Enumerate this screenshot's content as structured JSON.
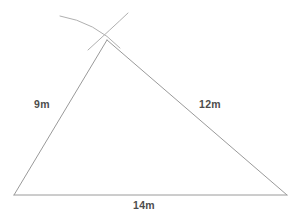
{
  "figure": {
    "background_color": "#ffffff",
    "stroke_color": "#9a9a9a",
    "arc_color": "#b0b0b0",
    "text_color": "#4d4d4d",
    "canvas": {
      "width": 294,
      "height": 218
    }
  },
  "triangle": {
    "vertices": {
      "apex": {
        "name": "apex-vertex",
        "x": 107,
        "y": 40
      },
      "bottom_left": {
        "name": "bottom-left-vertex",
        "x": 14,
        "y": 195
      },
      "bottom_right": {
        "name": "bottom-right-vertex",
        "x": 287,
        "y": 195
      }
    },
    "sides": [
      {
        "id": "left",
        "label": "9m",
        "from": "bottom_left",
        "to": "apex",
        "value": 9,
        "unit": "m"
      },
      {
        "id": "right",
        "label": "12m",
        "from": "apex",
        "to": "bottom_right",
        "value": 12,
        "unit": "m"
      },
      {
        "id": "base",
        "label": "14m",
        "from": "bottom_left",
        "to": "bottom_right",
        "value": 14,
        "unit": "m"
      }
    ]
  },
  "construction_arcs": [
    {
      "id": "arc-left",
      "description": "compass arc swept from bottom-left vertex with radius 9m",
      "start": {
        "x": 60,
        "y": 16
      },
      "control": {
        "x": 95,
        "y": 22
      },
      "end": {
        "x": 120,
        "y": 48
      }
    },
    {
      "id": "arc-right",
      "description": "compass arc swept from bottom-right vertex with radius 12m",
      "start": {
        "x": 128,
        "y": 13
      },
      "control": {
        "x": 111,
        "y": 29
      },
      "end": {
        "x": 88,
        "y": 50
      }
    }
  ]
}
